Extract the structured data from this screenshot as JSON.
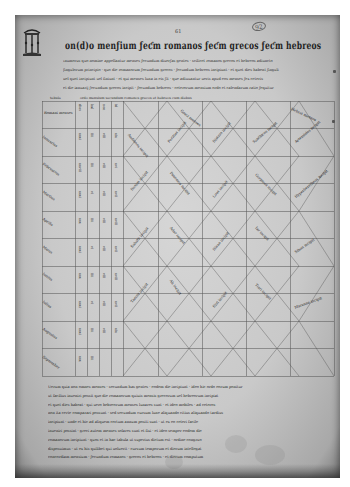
{
  "page": {
    "type": "medieval manuscript leaf",
    "folio_marks": {
      "top_center": "61",
      "top_right_circled": "92"
    },
    "colors": {
      "parchment": "#cfcfcf",
      "ink": "#222222",
      "ruling": "#6a6a6a",
      "edge_shadow": "#7a7a7a"
    }
  },
  "header": {
    "initial_icon": "decorated-initial-arcade",
    "title_display": "on(d)o menƒium ƒeƈm romanos ƒeƈm grecos ƒeƈm hebreos",
    "intro_lines": [
      "ιnumerus quo nomine appellantur menses ƒecundum diuerƒas gentes · scilicet romanos grecos et hebreos adiuncto",
      "ƒingulorum principio · quo die romanorum ƒecundum grecos · ƒecundum hebreos incipiunt · et quot dies habent ƒinguli",
      "uel quot incipiunt uel finiunt · et qui menses luna in eis ƒit · que adiuuantur ueris apud eos menses ƒex ceteris",
      "et die ianuarij ƒecundum grecos incipit · ƒecundum hebreos · ceterorum mensium ordo et calendarum ratio ƒequitur"
    ]
  },
  "table": {
    "caption_label": "tabula",
    "caption": "ordo mensium secundum romanos grecos et hebreos cum diebus",
    "columns": 7,
    "rows": 10,
    "header_cells": [
      "Romani menses",
      "dies",
      "kal",
      "non",
      "id",
      "Greci menses",
      "Hebrei menses"
    ],
    "first_column": [
      "Ianuarius",
      "Februarius",
      "Martius",
      "Aprilis",
      "Maius",
      "Iunius",
      "Iulius",
      "Augustus",
      "September",
      "October"
    ],
    "diagonal_entries": [
      "Audineos incipit",
      "Peritios incipit",
      "Distros incipit",
      "Xanthicos incipit",
      "Artemisios incipit",
      "Desios incipit",
      "Panemos incipit",
      "Loos incipit",
      "Gorpieos incipit",
      "Hyperberetheos incipit",
      "Sabath incipit",
      "Adar incipit",
      "Nisan incipit",
      "Iar incipit",
      "Siban incipit",
      "Tamuz incipit",
      "Ab incipit",
      "Elul incipit",
      "Tisri incipit",
      "Marsuan incipit"
    ]
  },
  "footer": {
    "lines": [
      "Uerum quia non omnes menses · secundum has gentes · eodem die incipiunt · ideo hic ordo eorum ponitur",
      "ut facilius inueniri possit quo die romanorum quiuis mensis grecorum uel hebreorum incipiat",
      "et quot dies habeat · qui uero hebreorum menses lunares sunt · et ideo mobiles · ad ceteros",
      "non ita certe comparari possunt · sed secundum cursum lune aliquando citius aliquando tardius",
      "incipiunt · unde et hic ad aliquem certum annum positi sunt · ut ex eo ceteri facile",
      "inueniri possint · greci autem menses solares sunt et fixi · et ideo semper eodem die",
      "romanorum incipiunt · quos et in hac tabula ut superius dictum est · ordine congruo",
      "disposuimus · ut ex his quilibet qui uoluerit · cursum temporum et dierum intellegat",
      "concordiam mensium · ƒecundum romanos · grecos et hebreos ·  et dierum computum"
    ]
  }
}
